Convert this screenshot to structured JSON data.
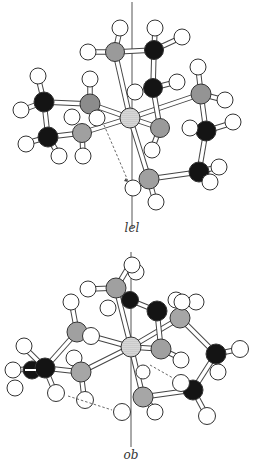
{
  "figure": {
    "panels": [
      {
        "id": "lel",
        "label": "lel",
        "description": "Tris(ethylenediamine) metal complex, lel conformation"
      },
      {
        "id": "ob",
        "label": "ob",
        "description": "Tris(ethylenediamine) metal complex, ob conformation"
      }
    ],
    "legend_colors": {
      "metal": "#bdbdbd",
      "nitrogen": "#9a9a9a",
      "carbon": "#141414",
      "hydrogen": "#ffffff",
      "bond": "#ffffff"
    }
  }
}
